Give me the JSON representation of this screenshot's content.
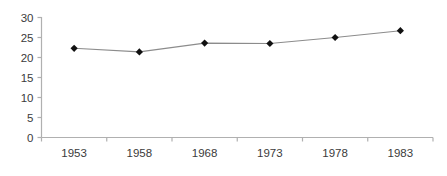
{
  "chart_data": {
    "type": "line",
    "title": "",
    "subtitle": "",
    "xlabel": "",
    "ylabel": "",
    "categories": [
      "1953",
      "1958",
      "1968",
      "1973",
      "1978",
      "1983"
    ],
    "values": [
      22.3,
      21.4,
      23.6,
      23.5,
      25.0,
      26.7
    ],
    "series": [
      {
        "name": "",
        "values": [
          22.3,
          21.4,
          23.6,
          23.5,
          25.0,
          26.7
        ]
      }
    ],
    "ylim": [
      0,
      30
    ],
    "y_ticks": [
      0,
      5,
      10,
      15,
      20,
      25,
      30
    ],
    "y_tick_labels": [
      "0",
      "5",
      "10",
      "15",
      "20",
      "25",
      "30"
    ],
    "x_tick_labels": [
      "1953",
      "1958",
      "1968",
      "1973",
      "1978",
      "1983"
    ],
    "grid": false,
    "legend": false,
    "legend_position": "none",
    "marker": "diamond",
    "colors": {
      "line": "#8c8c8c",
      "marker": "#111111",
      "axis": "#b0b0b0",
      "tick_text": "#3b3b3b",
      "background": "#ffffff"
    }
  }
}
